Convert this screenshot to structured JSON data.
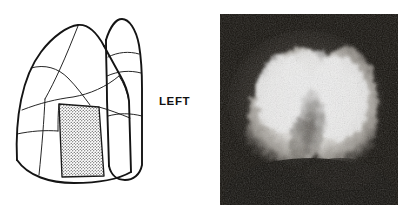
{
  "figure": {
    "kind": "medical-figure",
    "background_color": "#ffffff",
    "width": 417,
    "height": 219
  },
  "diagram": {
    "name": "lung-segment-diagram",
    "view": "left lateral",
    "line_color": "#1a1a1a",
    "fill_color": "#ffffff",
    "stipple": {
      "name": "highlighted-segment",
      "pattern": "dotted-stipple",
      "dot_color": "#2b2b2b",
      "background_color": "#ffffff"
    }
  },
  "label": {
    "side_text": "LEFT",
    "color": "#111111"
  },
  "scan": {
    "name": "lung-scintigraphy-scan",
    "modality": "nuclear-medicine-perfusion-scan",
    "background_color": "#15120f",
    "activity_color": "#ffffff",
    "description": "Grainy scintigraphic image of the lung fields: a bright dome-shaped region of radiotracer uptake with a darker central cleft, set on a dark noisy background."
  }
}
